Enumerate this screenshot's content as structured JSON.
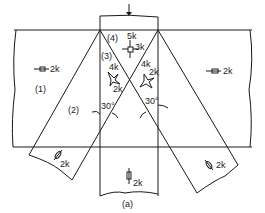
{
  "figure": {
    "caption": "(a)",
    "applied_load_arrow": "downward-arrow",
    "regions": [
      {
        "id": "1",
        "label": "(1)",
        "stress": "2k",
        "direction": "horizontal tension"
      },
      {
        "id": "2",
        "label": "(2)",
        "stress": "2k",
        "direction": "along diagonal"
      },
      {
        "id": "3",
        "label": "(3)",
        "stress_a": "4k",
        "stress_b": "2k"
      },
      {
        "id": "4",
        "label": "(4)",
        "stress_a": "5k",
        "stress_b": "3k"
      }
    ],
    "labels": {
      "region1": "(1)",
      "region2": "(2)",
      "region3": "(3)",
      "region4": "(4)",
      "left_band_stress": "2k",
      "right_band_stress": "2k",
      "left_diag_stress": "2k",
      "right_diag_stress": "2k",
      "column_stress": "2k",
      "r4_top": "5k",
      "r4_side": "3k",
      "r3_left_top": "4k",
      "r3_left_bottom": "2k",
      "r3_right_top": "4k",
      "r3_right_side": "2k",
      "angle_left": "30°",
      "angle_right": "30°",
      "caption": "(a)"
    },
    "line_color": "#1a1a1a"
  }
}
